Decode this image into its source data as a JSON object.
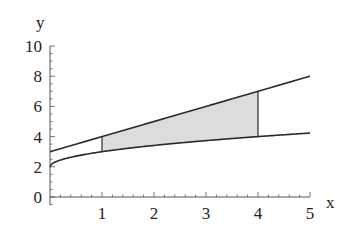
{
  "chart_data": {
    "type": "line",
    "title": "",
    "xlabel": "x",
    "ylabel": "y",
    "xlim": [
      0,
      5
    ],
    "ylim": [
      0,
      10
    ],
    "x_ticks": [
      1,
      2,
      3,
      4,
      5
    ],
    "y_ticks": [
      0,
      2,
      4,
      6,
      8,
      10
    ],
    "grid": false,
    "legend": null,
    "series": [
      {
        "name": "upper",
        "expression": "y = x + 3",
        "x": [
          0,
          1,
          2,
          3,
          4,
          5
        ],
        "values": [
          3,
          4,
          5,
          6,
          7,
          8
        ]
      },
      {
        "name": "lower",
        "expression": "y = sqrt(x) + 2",
        "x": [
          0,
          1,
          2,
          3,
          4,
          5
        ],
        "values": [
          2,
          3,
          3.41,
          3.73,
          4,
          4.24
        ]
      }
    ],
    "shaded_region": {
      "between": [
        "upper",
        "lower"
      ],
      "x_from": 1,
      "x_to": 4,
      "color": "#dcdcdc"
    },
    "colors": {
      "line": "#2a2a2a",
      "axis": "#555555",
      "fill": "#dcdcdc"
    }
  }
}
